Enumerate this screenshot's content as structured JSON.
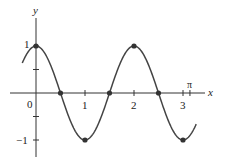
{
  "chart_data": {
    "type": "line",
    "title": "",
    "function": "y = cos(pi x)",
    "xlabel": "x",
    "ylabel": "y",
    "xlim": [
      -0.28,
      3.27
    ],
    "ylim": [
      -1,
      1
    ],
    "x_ticks": [
      {
        "value": 0,
        "label": "0"
      },
      {
        "value": 1,
        "label": "1"
      },
      {
        "value": 2,
        "label": "2"
      },
      {
        "value": 3,
        "label": "3"
      },
      {
        "value": 3.14159,
        "label": "π"
      }
    ],
    "y_ticks": [
      {
        "value": 1,
        "label": "1"
      },
      {
        "value": 0.5,
        "label": ""
      },
      {
        "value": -0.5,
        "label": ""
      },
      {
        "value": -1,
        "label": "−1"
      }
    ],
    "marked_points": [
      {
        "x": 0,
        "y": 1
      },
      {
        "x": 0.5,
        "y": 0
      },
      {
        "x": 1,
        "y": -1
      },
      {
        "x": 1.5,
        "y": 0
      },
      {
        "x": 2,
        "y": 1
      },
      {
        "x": 2.5,
        "y": 0
      },
      {
        "x": 3,
        "y": -1
      }
    ],
    "grid": false,
    "legend": null
  },
  "labels": {
    "x_axis": "x",
    "y_axis": "y",
    "origin": "0",
    "pi": "π",
    "one": "1",
    "two": "2",
    "three": "3",
    "y_one": "1",
    "y_neg_one": "−1"
  }
}
